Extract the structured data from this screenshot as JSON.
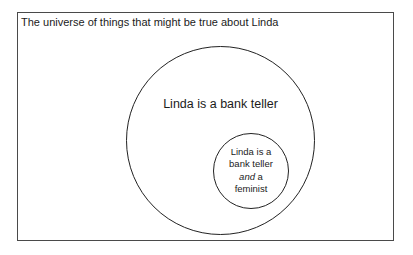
{
  "frame": {
    "title": "The universe of things that might be true about Linda"
  },
  "diagram": {
    "outer_circle": {
      "label": "Linda is a bank teller"
    },
    "inner_circle": {
      "line1": "Linda is a",
      "line2": "bank teller",
      "line3_italic": "and",
      "line3_rest": " a",
      "line4": "feminist"
    }
  },
  "colors": {
    "frame_border": "#4a4a4a",
    "circle_stroke": "#222222",
    "text": "#1b1b1b",
    "background": "#ffffff"
  }
}
